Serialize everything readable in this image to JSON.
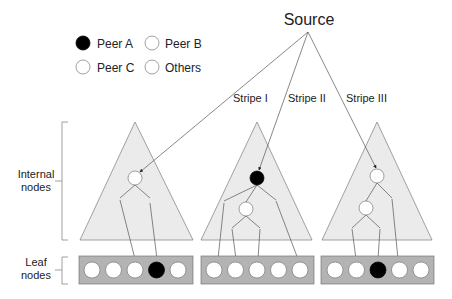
{
  "title": "Source",
  "legend": {
    "items": [
      {
        "label": "Peer A",
        "fill": "#000000"
      },
      {
        "label": "Peer B",
        "fill": "#ffffff"
      },
      {
        "label": "Peer C",
        "fill": "#ffffff"
      },
      {
        "label": "Others",
        "fill": "#ffffff"
      }
    ]
  },
  "stripes": [
    "Stripe I",
    "Stripe II",
    "Stripe III"
  ],
  "brackets": {
    "internal": [
      "Internal",
      "nodes"
    ],
    "leaf": [
      "Leaf",
      "nodes"
    ]
  },
  "colors": {
    "triangle_fill": "#ebebeb",
    "triangle_stroke": "#8a8a8a",
    "leafbox_fill": "#b3b3b3",
    "peer_a": "#000000",
    "node_white": "#ffffff",
    "line": "#555555"
  },
  "leaf_rows": [
    [
      "white",
      "white",
      "white",
      "black",
      "white"
    ],
    [
      "white",
      "white",
      "white",
      "white",
      "white"
    ],
    [
      "white",
      "white",
      "black",
      "white",
      "white"
    ]
  ]
}
